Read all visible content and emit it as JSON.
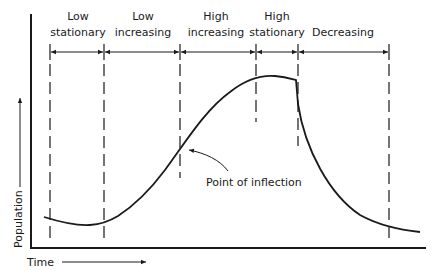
{
  "diagram": {
    "title": "",
    "axes": {
      "x_label": "Time",
      "y_label": "Population"
    },
    "phases": [
      {
        "line1": "Low",
        "line2": "stationary",
        "x_start": 50,
        "x_end": 104
      },
      {
        "line1": "Low",
        "line2": "increasing",
        "x_start": 104,
        "x_end": 180
      },
      {
        "line1": "High",
        "line2": "increasing",
        "x_start": 180,
        "x_end": 256
      },
      {
        "line1": "High",
        "line2": "stationary",
        "x_start": 256,
        "x_end": 298
      },
      {
        "line1": "",
        "line2": "Decreasing",
        "x_start": 298,
        "x_end": 389
      }
    ],
    "annotations": {
      "inflection_label": "Point of inflection"
    },
    "colors": {
      "ink": "#1a1a1a",
      "background": "#ffffff"
    }
  }
}
